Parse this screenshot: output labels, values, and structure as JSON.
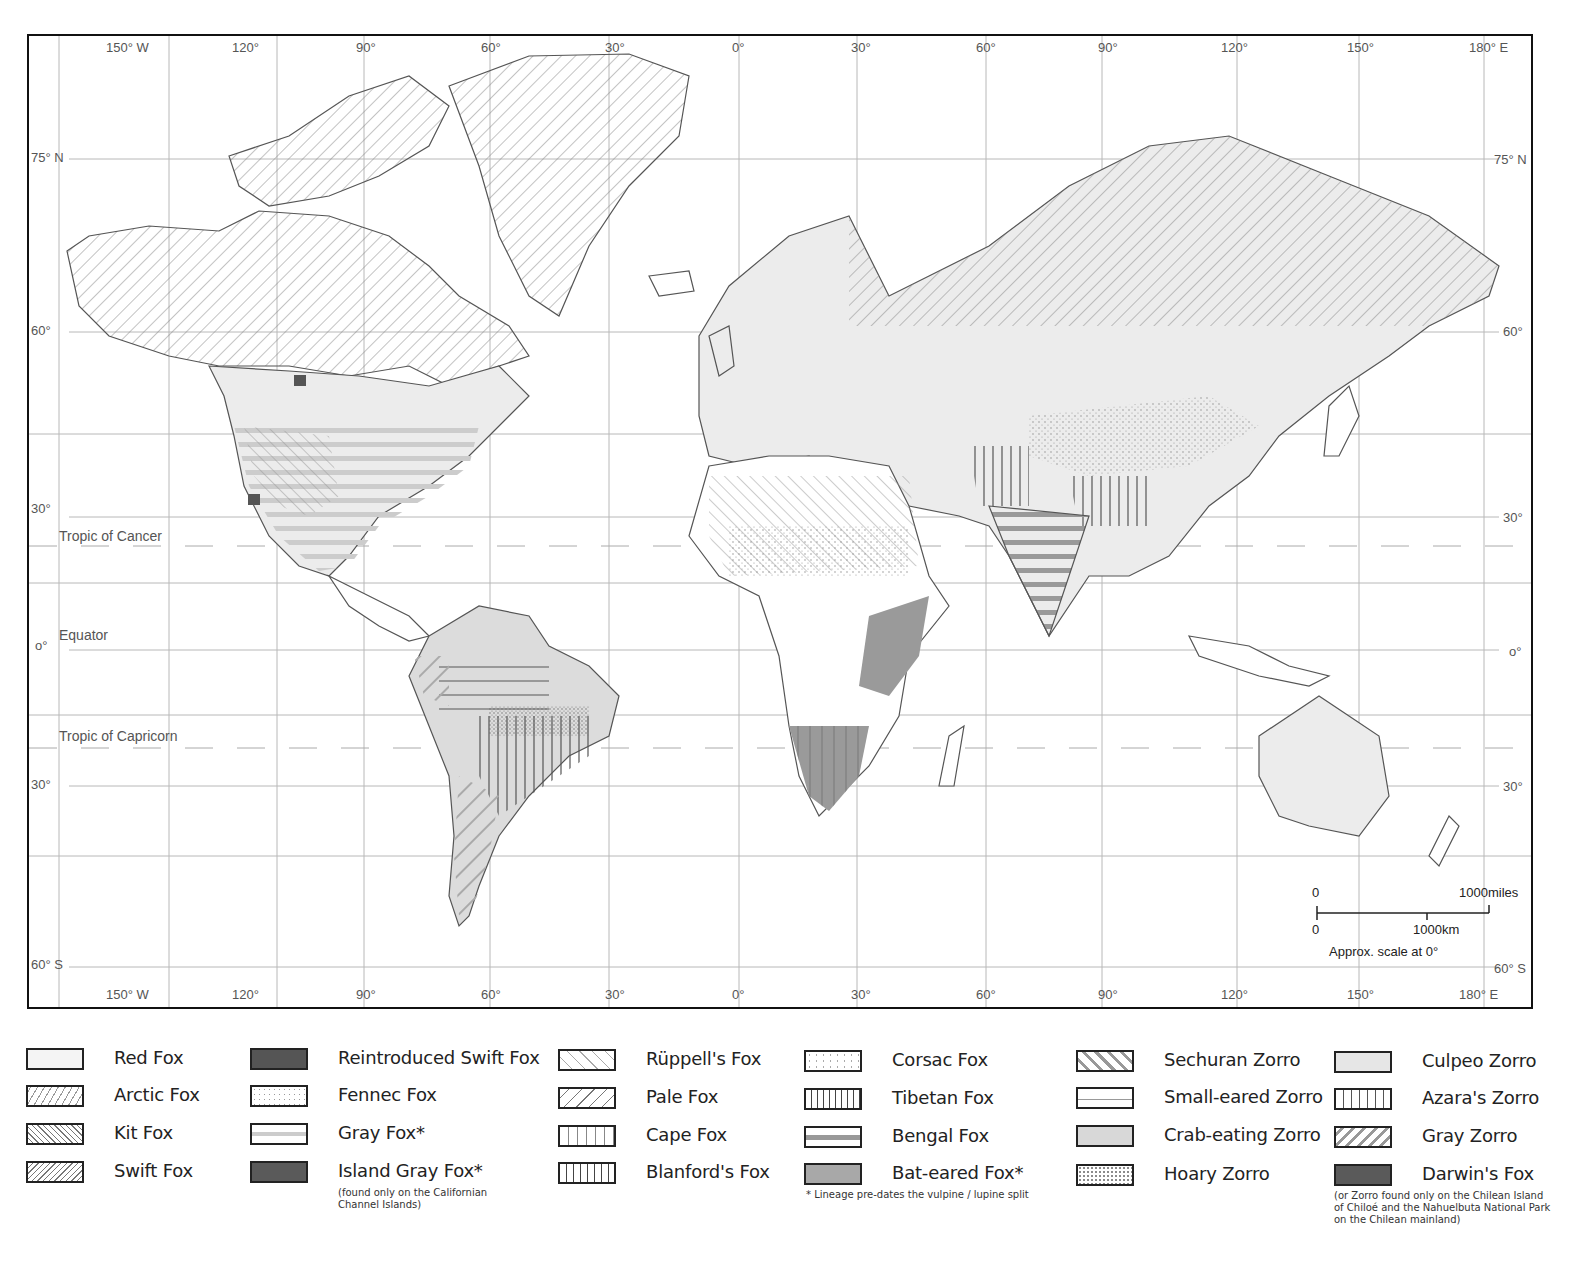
{
  "map": {
    "title": "World distribution of fox and zorro species",
    "projection": "Mercator",
    "longitude_labels_top": [
      "150° W",
      "120°",
      "90°",
      "60°",
      "30°",
      "0°",
      "30°",
      "60°",
      "90°",
      "120°",
      "150°",
      "180° E"
    ],
    "longitude_labels_bottom": [
      "150° W",
      "120°",
      "90°",
      "60°",
      "30°",
      "0°",
      "30°",
      "60°",
      "90°",
      "120°",
      "150°",
      "180° E"
    ],
    "latitude_labels_left": [
      "75° N",
      "60°",
      "30°",
      "o°",
      "30°",
      "60° S"
    ],
    "latitude_labels_right": [
      "75° N",
      "60°",
      "30°",
      "o°",
      "30°",
      "60° S"
    ],
    "reference_lines": {
      "tropic_of_cancer": "Tropic of Cancer",
      "equator": "Equator",
      "tropic_of_capricorn": "Tropic of Capricorn"
    },
    "scale_bar": {
      "top_start": "0",
      "top_end": "1000miles",
      "bottom_start": "0",
      "bottom_end": "1000km",
      "caption": "Approx. scale at 0°"
    },
    "colors": {
      "frame": "#111111",
      "grid": "#b0b0b0",
      "coast": "#555555",
      "light_fill": "#ececec",
      "medium_fill": "#c8c8c8",
      "dark_fill": "#9a9a9a",
      "very_dark_fill": "#555555"
    }
  },
  "legend": {
    "columns": [
      {
        "items": [
          {
            "label": "Red Fox",
            "pattern": "solid-light"
          },
          {
            "label": "Arctic Fox",
            "pattern": "diag-fwd-light"
          },
          {
            "label": "Kit Fox",
            "pattern": "diag-back-dense"
          },
          {
            "label": "Swift Fox",
            "pattern": "diag-fwd-dense"
          }
        ]
      },
      {
        "items": [
          {
            "label": "Reintroduced Swift Fox",
            "pattern": "solid-very-dark"
          },
          {
            "label": "Fennec Fox",
            "pattern": "dots"
          },
          {
            "label": "Gray Fox*",
            "pattern": "horizontal-band"
          },
          {
            "label": "Island Gray Fox*",
            "pattern": "solid-very-dark"
          }
        ],
        "note": "(found only on the Californian Channel Islands)"
      },
      {
        "items": [
          {
            "label": "Rüppell's Fox",
            "pattern": "diag-back-sparse"
          },
          {
            "label": "Pale Fox",
            "pattern": "diag-fwd-sparse"
          },
          {
            "label": "Cape Fox",
            "pattern": "vertical-light"
          },
          {
            "label": "Blanford's Fox",
            "pattern": "vertical-dark"
          }
        ]
      },
      {
        "items": [
          {
            "label": "Corsac Fox",
            "pattern": "dots-sparse"
          },
          {
            "label": "Tibetan Fox",
            "pattern": "vertical-dense"
          },
          {
            "label": "Bengal Fox",
            "pattern": "horizontal-thick"
          },
          {
            "label": "Bat-eared Fox*",
            "pattern": "solid-dark"
          }
        ],
        "note": "* Lineage pre-dates the vulpine / lupine split"
      },
      {
        "items": [
          {
            "label": "Sechuran Zorro",
            "pattern": "diag-back-thick"
          },
          {
            "label": "Small-eared Zorro",
            "pattern": "horizontal-thin"
          },
          {
            "label": "Crab-eating Zorro",
            "pattern": "solid-medium"
          },
          {
            "label": "Hoary Zorro",
            "pattern": "dots-dense"
          }
        ]
      },
      {
        "items": [
          {
            "label": "Culpeo Zorro",
            "pattern": "solid-light2"
          },
          {
            "label": "Azara's  Zorro",
            "pattern": "vertical-medium"
          },
          {
            "label": "Gray Zorro",
            "pattern": "diag-fwd-thick"
          },
          {
            "label": "Darwin's  Fox",
            "pattern": "solid-very-dark"
          }
        ],
        "note": "(or Zorro found only on the Chilean Island of Chiloé and the Nahuelbuta National Park on the Chilean mainland)"
      }
    ]
  }
}
